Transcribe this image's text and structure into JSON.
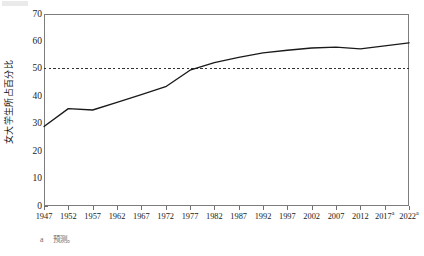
{
  "figure": {
    "y_axis_title": "女大学生所占百分比",
    "footnote_marker": "a",
    "footnote_text": "预测。"
  },
  "chart_data": {
    "type": "line",
    "title": "",
    "subtitle": "",
    "xlabel": "",
    "ylabel": "女大学生所占百分比",
    "categories": [
      "1947",
      "1952",
      "1957",
      "1962",
      "1967",
      "1972",
      "1977",
      "1982",
      "1987",
      "1992",
      "1997",
      "2002",
      "2007",
      "2012",
      "2017",
      "2022"
    ],
    "tick_labels": [
      "1947",
      "1952",
      "1957",
      "1962",
      "1967",
      "1972",
      "1977",
      "1982",
      "1987",
      "1992",
      "1997",
      "2002",
      "2007",
      "2012",
      "2017a",
      "2022a"
    ],
    "projected_categories": [
      "2017",
      "2022"
    ],
    "projection_marker": "a",
    "x": [
      1947,
      1952,
      1957,
      1962,
      1967,
      1972,
      1977,
      1982,
      1987,
      1992,
      1997,
      2002,
      2007,
      2012,
      2017,
      2022
    ],
    "values": [
      29.0,
      35.5,
      35.0,
      37.8,
      40.6,
      43.5,
      49.5,
      52.3,
      54.2,
      55.8,
      56.8,
      57.6,
      57.9,
      57.3,
      58.4,
      59.5
    ],
    "series": [
      {
        "name": "女大学生所占百分比",
        "color": "#1a1a1a",
        "values": [
          29.0,
          35.5,
          35.0,
          37.8,
          40.6,
          43.5,
          49.5,
          52.3,
          54.2,
          55.8,
          56.8,
          57.6,
          57.9,
          57.3,
          58.4,
          59.5
        ]
      }
    ],
    "ylim": [
      0,
      70
    ],
    "xlim": [
      1947,
      2022
    ],
    "yticks": [
      0,
      10,
      20,
      30,
      40,
      50,
      60,
      70
    ],
    "ytick_labels": [
      "0",
      "10",
      "20",
      "30",
      "40",
      "50",
      "60",
      "70"
    ],
    "grid": false,
    "legend": false,
    "legend_position": "none",
    "annotations": [
      {
        "type": "reference-line",
        "orientation": "horizontal",
        "value": 50,
        "style": "dashed",
        "color": "#333333",
        "label": ""
      }
    ],
    "colors": {
      "line": "#1a1a1a",
      "reference_line": "#333333",
      "frame": "#7d7d7d",
      "background": "#ffffff",
      "text": "#1b1b1b"
    }
  }
}
